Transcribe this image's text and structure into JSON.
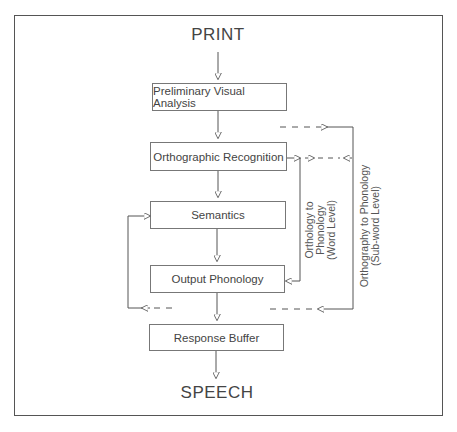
{
  "diagram": {
    "input_label": "PRINT",
    "output_label": "SPEECH",
    "boxes": [
      {
        "id": "pva",
        "label": "Preliminary Visual Analysis"
      },
      {
        "id": "ortho",
        "label": "Orthographic Recognition"
      },
      {
        "id": "sem",
        "label": "Semantics"
      },
      {
        "id": "outphon",
        "label": "Output Phonology"
      },
      {
        "id": "buffer",
        "label": "Response Buffer"
      }
    ],
    "routes": {
      "word_level": {
        "line1": "Orthology to",
        "line2": "Phonology",
        "line3": "(Word Level)"
      },
      "subword_level": {
        "line1": "Orthography to Phonology",
        "line2": "(Sub-word Level)"
      }
    },
    "colors": {
      "line": "#555555",
      "text": "#444444",
      "frame": "#555555"
    }
  }
}
